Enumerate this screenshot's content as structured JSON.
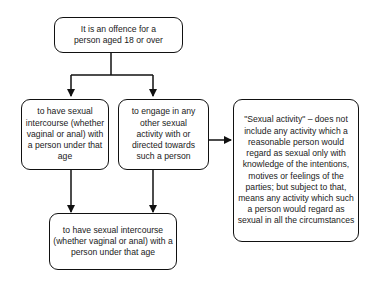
{
  "diagram": {
    "nodes": {
      "root": {
        "text": "It is an offence for a person aged 18 or over"
      },
      "intercourse": {
        "text": "to have sexual intercourse (whether vaginal or anal) with a person under that age"
      },
      "other_activity": {
        "text": "to engage in any other sexual activity with or directed towards such a person"
      },
      "definition": {
        "text": "\"Sexual activity\" – does not include any activity which a reasonable person would regard as sexual only with knowledge of the intentions, motives or feelings of the parties; but subject to that, means any activity which such a person would regard as sexual in all the circumstances"
      },
      "bottom": {
        "text": "to have sexual intercourse (whether vaginal or anal) with a person under that age"
      }
    },
    "edges": [
      {
        "from": "root",
        "to": "intercourse"
      },
      {
        "from": "root",
        "to": "other_activity"
      },
      {
        "from": "other_activity",
        "to": "definition"
      },
      {
        "from": "intercourse",
        "to": "bottom"
      },
      {
        "from": "other_activity",
        "to": "bottom"
      }
    ],
    "colors": {
      "stroke": "#111111",
      "background": "#ffffff",
      "text": "#1a1a1a"
    }
  }
}
